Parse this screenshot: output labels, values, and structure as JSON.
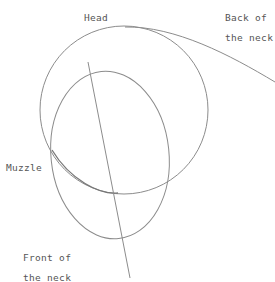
{
  "labels": {
    "head": "Head",
    "back_of_neck_1": "Back of",
    "back_of_neck_2": "the neck",
    "muzzle": "Muzzle",
    "front_of_neck_1": "Front of",
    "front_of_neck_2": "the neck"
  },
  "colors": {
    "background": "#ffffff",
    "stroke": "#8a8a8a",
    "text": "#555555"
  }
}
